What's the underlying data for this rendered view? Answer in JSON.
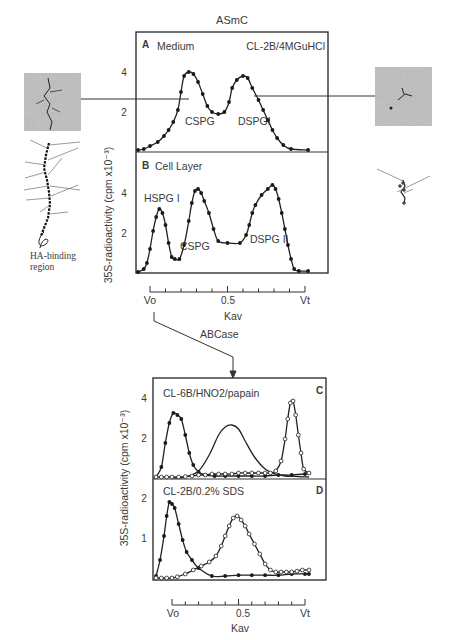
{
  "figure": {
    "top_title": "ASmC",
    "arrow_label": "ABCase",
    "ha_label_line1": "HA-binding",
    "ha_label_line2": "region",
    "ylabel": "35S-radioactivity (cpm x10⁻³)",
    "xaxis": {
      "left": "Vo",
      "mid": "0.5",
      "right": "Vt",
      "label": "Kav"
    },
    "colors": {
      "ink": "#2a2a2a",
      "frame": "#333333",
      "micrograph": "#8a8a8a"
    }
  },
  "panels": {
    "A": {
      "letter": "A",
      "title": "Medium",
      "condition": "CL-2B/4MGuHCl",
      "peak1": "CSPG",
      "peak2": "DSPGI",
      "ytick_hi": "4",
      "ytick_lo": "2"
    },
    "B": {
      "letter": "B",
      "title": "Cell Layer",
      "peak1": "HSPG I",
      "peak2": "CSPG",
      "peak3": "DSPG II",
      "ytick_hi": "4",
      "ytick_lo": "2"
    },
    "C": {
      "letter": "C",
      "condition": "CL-6B/HNO2/papain",
      "ytick_hi": "4",
      "ytick_lo": "2"
    },
    "D": {
      "letter": "D",
      "condition": "CL-2B/0.2% SDS",
      "ytick_hi": "2",
      "ytick_lo": "1"
    }
  },
  "chart_data": [
    {
      "type": "line",
      "panel": "A",
      "title": "Medium (CL-2B/4MGuHCl)",
      "xlabel": "Kav",
      "ylabel": "35S-radioactivity (cpm x10^-3)",
      "ylim": [
        0,
        5
      ],
      "xlim": [
        0,
        1
      ],
      "series": [
        {
          "name": "Medium",
          "marker": "filled",
          "x": [
            -0.08,
            -0.04,
            0.0,
            0.05,
            0.09,
            0.12,
            0.15,
            0.18,
            0.2,
            0.22,
            0.25,
            0.28,
            0.31,
            0.34,
            0.37,
            0.4,
            0.44,
            0.48,
            0.51,
            0.53,
            0.56,
            0.6,
            0.63,
            0.66,
            0.7,
            0.73,
            0.76,
            0.79,
            0.82,
            0.86,
            0.91,
            1.02
          ],
          "y": [
            0.1,
            0.15,
            0.3,
            0.5,
            0.8,
            1.1,
            1.5,
            2.1,
            3.0,
            3.8,
            4.0,
            3.9,
            3.5,
            2.9,
            2.3,
            2.0,
            1.9,
            2.0,
            2.5,
            3.2,
            3.6,
            3.8,
            3.7,
            3.2,
            2.6,
            2.1,
            1.6,
            1.1,
            0.7,
            0.35,
            0.15,
            0.1
          ]
        }
      ],
      "annotations": [
        "CSPG",
        "DSPGI"
      ]
    },
    {
      "type": "line",
      "panel": "B",
      "title": "Cell Layer",
      "xlabel": "Kav",
      "ylabel": "35S-radioactivity (cpm x10^-3)",
      "ylim": [
        0,
        5
      ],
      "xlim": [
        0,
        1
      ],
      "series": [
        {
          "name": "Cell Layer",
          "marker": "filled",
          "x": [
            -0.08,
            -0.04,
            -0.02,
            0.0,
            0.02,
            0.04,
            0.06,
            0.08,
            0.1,
            0.12,
            0.14,
            0.16,
            0.19,
            0.22,
            0.25,
            0.27,
            0.29,
            0.31,
            0.33,
            0.35,
            0.38,
            0.41,
            0.44,
            0.5,
            0.58,
            0.62,
            0.64,
            0.66,
            0.68,
            0.72,
            0.76,
            0.79,
            0.81,
            0.83,
            0.85,
            0.87,
            0.89,
            0.91,
            0.93,
            0.96,
            1.02
          ],
          "y": [
            0.05,
            0.2,
            0.5,
            1.2,
            2.1,
            2.8,
            3.2,
            3.0,
            2.4,
            1.5,
            0.8,
            0.7,
            0.7,
            1.4,
            2.6,
            3.5,
            4.1,
            4.2,
            4.0,
            3.6,
            3.0,
            2.2,
            1.6,
            1.5,
            1.5,
            1.9,
            2.4,
            3.0,
            3.4,
            3.9,
            4.2,
            4.4,
            4.2,
            3.7,
            3.0,
            2.2,
            1.4,
            0.7,
            0.2,
            0.1,
            0.1
          ]
        }
      ],
      "annotations": [
        "HSPG I",
        "CSPG",
        "DSPG II"
      ]
    },
    {
      "type": "line",
      "panel": "C",
      "title": "CL-6B/HNO2/papain",
      "xlabel": "Kav",
      "ylabel": "35S-radioactivity (cpm x10^-3)",
      "ylim": [
        0,
        5
      ],
      "xlim": [
        0,
        1
      ],
      "series": [
        {
          "name": "filled",
          "marker": "filled",
          "x": [
            -0.12,
            -0.08,
            -0.05,
            -0.02,
            0.01,
            0.04,
            0.07,
            0.1,
            0.13,
            0.16,
            0.2,
            0.25,
            0.32,
            0.4,
            0.5,
            0.6,
            0.7,
            0.8,
            0.9,
            1.0,
            1.03
          ],
          "y": [
            0.1,
            0.6,
            1.8,
            2.8,
            3.3,
            3.2,
            3.0,
            2.2,
            1.3,
            0.7,
            0.35,
            0.2,
            0.15,
            0.15,
            0.15,
            0.15,
            0.15,
            0.2,
            0.2,
            0.25,
            0.3
          ]
        },
        {
          "name": "unmarked",
          "marker": "none",
          "x": [
            0.0,
            0.1,
            0.2,
            0.28,
            0.35,
            0.4,
            0.45,
            0.5,
            0.55,
            0.62,
            0.7,
            0.78,
            0.85,
            0.95,
            1.03
          ],
          "y": [
            0.05,
            0.1,
            0.4,
            1.2,
            2.2,
            2.6,
            2.7,
            2.5,
            1.9,
            1.1,
            0.5,
            0.25,
            0.15,
            0.12,
            0.1
          ]
        },
        {
          "name": "open",
          "marker": "open",
          "x": [
            -0.12,
            -0.08,
            -0.04,
            0.0,
            0.05,
            0.1,
            0.15,
            0.2,
            0.25,
            0.3,
            0.35,
            0.4,
            0.45,
            0.5,
            0.55,
            0.6,
            0.65,
            0.7,
            0.74,
            0.78,
            0.82,
            0.85,
            0.87,
            0.89,
            0.91,
            0.93,
            0.95,
            0.97,
            0.99,
            1.03
          ],
          "y": [
            0.1,
            0.1,
            0.1,
            0.1,
            0.1,
            0.12,
            0.15,
            0.2,
            0.2,
            0.25,
            0.25,
            0.25,
            0.25,
            0.3,
            0.3,
            0.3,
            0.3,
            0.3,
            0.3,
            0.4,
            0.9,
            2.0,
            3.0,
            3.8,
            3.9,
            3.2,
            2.2,
            1.3,
            0.5,
            0.3
          ]
        }
      ]
    },
    {
      "type": "line",
      "panel": "D",
      "title": "CL-2B/0.2% SDS",
      "xlabel": "Kav",
      "ylabel": "35S-radioactivity (cpm x10^-3)",
      "ylim": [
        0,
        2.5
      ],
      "xlim": [
        0,
        1
      ],
      "series": [
        {
          "name": "filled",
          "marker": "filled",
          "x": [
            -0.12,
            -0.09,
            -0.06,
            -0.04,
            -0.02,
            0.0,
            0.02,
            0.05,
            0.08,
            0.11,
            0.15,
            0.2,
            0.3,
            0.4,
            0.5,
            0.6,
            0.7,
            0.8,
            0.9,
            1.0,
            1.03
          ],
          "y": [
            0.1,
            0.5,
            1.1,
            1.6,
            1.95,
            1.9,
            1.8,
            1.4,
            1.0,
            0.7,
            0.5,
            0.3,
            0.1,
            0.1,
            0.12,
            0.12,
            0.12,
            0.12,
            0.15,
            0.15,
            0.15
          ]
        },
        {
          "name": "open",
          "marker": "open",
          "x": [
            -0.12,
            -0.08,
            -0.04,
            0.0,
            0.04,
            0.1,
            0.16,
            0.22,
            0.28,
            0.33,
            0.37,
            0.4,
            0.43,
            0.46,
            0.49,
            0.52,
            0.55,
            0.58,
            0.62,
            0.66,
            0.7,
            0.74,
            0.78,
            0.82,
            0.86,
            0.9,
            0.94,
            0.98,
            1.03
          ],
          "y": [
            0.05,
            0.05,
            0.05,
            0.05,
            0.08,
            0.15,
            0.25,
            0.35,
            0.45,
            0.6,
            0.85,
            1.1,
            1.35,
            1.55,
            1.6,
            1.5,
            1.35,
            1.15,
            0.9,
            0.65,
            0.4,
            0.25,
            0.2,
            0.2,
            0.2,
            0.2,
            0.22,
            0.25,
            0.25
          ]
        }
      ]
    }
  ]
}
